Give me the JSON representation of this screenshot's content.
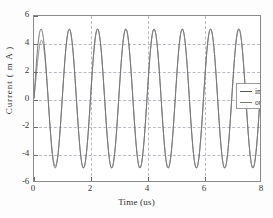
{
  "chart_data": {
    "type": "line",
    "title": "",
    "xlabel": "Time (us)",
    "ylabel": "Current ( m A )",
    "xlim": [
      0,
      8
    ],
    "ylim": [
      -6,
      6
    ],
    "xticks": [
      0,
      2,
      4,
      6,
      8
    ],
    "yticks": [
      -6,
      -4,
      -2,
      0,
      2,
      4,
      6
    ],
    "xtick_labels": [
      "0",
      "2",
      "4",
      "6",
      "8"
    ],
    "ytick_labels": [
      "-6",
      "-4",
      "-2",
      "0",
      "2",
      "4",
      "6"
    ],
    "grid": true,
    "grid_style": "dashed",
    "grid_color": "#b9b9c4",
    "legend_position": "upper-right-inside",
    "series": [
      {
        "name": "input",
        "color": "#555555",
        "style": "solid",
        "frequency_mhz": 1.0,
        "amplitude_ma": 5.05,
        "phase_deg": 0,
        "description": "Steady sinusoid, 8 full cycles over 0-8 us, peaks near +5 mA and troughs near -5 mA."
      },
      {
        "name": "output",
        "color": "#777777",
        "style": "solid",
        "frequency_mhz": 1.0,
        "amplitude_ma": 5.05,
        "phase_deg": 0,
        "startup_transient": true,
        "first_peak_ma": 2.95,
        "settle_time_us": 0.6,
        "description": "Overlaps the input after a brief startup transient; first peak reaches only about 3 mA before settling onto the 5 mA envelope."
      }
    ],
    "sampled_points": {
      "t_us": [
        0.0,
        0.25,
        0.5,
        0.75,
        1.0,
        1.25,
        1.5,
        1.75,
        2.0,
        2.25,
        2.5,
        2.75,
        3.0,
        3.25,
        3.5,
        3.75,
        4.0,
        4.25,
        4.5,
        4.75,
        5.0,
        5.25,
        5.5,
        5.75,
        6.0,
        6.25,
        6.5,
        6.75,
        7.0,
        7.25,
        7.5,
        7.75,
        8.0
      ],
      "input_ma": [
        0.0,
        5.05,
        0.0,
        -5.05,
        0.0,
        5.05,
        0.0,
        -5.05,
        0.0,
        5.05,
        0.0,
        -5.05,
        0.0,
        5.05,
        0.0,
        -5.05,
        0.0,
        5.05,
        0.0,
        -5.05,
        0.0,
        5.05,
        0.0,
        -5.05,
        0.0,
        5.05,
        0.0,
        -5.05,
        0.0,
        5.05,
        0.0,
        -5.05,
        0.0
      ],
      "output_ma": [
        0.0,
        2.95,
        0.0,
        -5.05,
        0.0,
        5.05,
        0.0,
        -5.05,
        0.0,
        5.05,
        0.0,
        -5.05,
        0.0,
        5.05,
        0.0,
        -5.05,
        0.0,
        5.05,
        0.0,
        -5.05,
        0.0,
        5.05,
        0.0,
        -5.05,
        0.0,
        5.05,
        0.0,
        -5.05,
        0.0,
        5.05,
        0.0,
        -5.05,
        0.0
      ]
    },
    "legend": [
      {
        "label": "input"
      },
      {
        "label": "output"
      }
    ]
  }
}
